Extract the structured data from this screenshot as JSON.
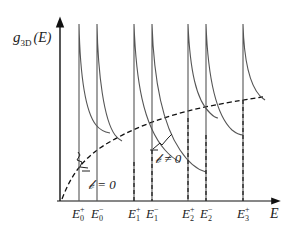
{
  "figure": {
    "y_axis_label": {
      "main": "g",
      "sub": "3D",
      "sup": "𝒷",
      "arg": "(E)"
    },
    "x_axis_label": "E",
    "annotations": {
      "b_zero": "𝒷 = 0",
      "b_nonzero": "𝒷 ≠ 0"
    },
    "ticks": [
      {
        "label": "E",
        "sub": "0",
        "sup": "+",
        "x": 79
      },
      {
        "label": "E",
        "sub": "0",
        "sup": "−",
        "x": 97
      },
      {
        "label": "E",
        "sub": "1",
        "sup": "+",
        "x": 134
      },
      {
        "label": "E",
        "sub": "1",
        "sup": "−",
        "x": 152
      },
      {
        "label": "E",
        "sub": "2",
        "sup": "+",
        "x": 188
      },
      {
        "label": "E",
        "sub": "2",
        "sup": "−",
        "x": 206
      },
      {
        "label": "E",
        "sub": "3",
        "sup": "+",
        "x": 243
      }
    ],
    "colors": {
      "line": "#555555",
      "axis": "#111111",
      "text": "#222222"
    }
  }
}
